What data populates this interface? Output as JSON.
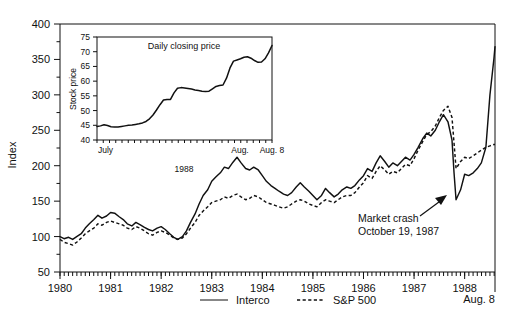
{
  "chart_data": {
    "type": "line",
    "title": "",
    "xlabel": "",
    "ylabel": "Index",
    "ylim": [
      50,
      400
    ],
    "yticks": [
      50,
      100,
      150,
      200,
      250,
      300,
      350,
      400
    ],
    "xlim": [
      1980.0,
      1988.6
    ],
    "xticks": [
      1980,
      1981,
      1982,
      1983,
      1984,
      1985,
      1986,
      1987,
      1988
    ],
    "xtick_labels": [
      "1980",
      "1981",
      "1982",
      "1983",
      "1984",
      "1985",
      "1986",
      "1987",
      "1988"
    ],
    "x_end_label": "Aug. 8",
    "grid": false,
    "legend_position": "bottom",
    "minor_ticks": "monthly",
    "annotations": [
      {
        "text_line1": "Market crash",
        "text_line2": "October 19, 1987",
        "points_to": "Interco trough, October 1987"
      }
    ],
    "series": [
      {
        "name": "Interco",
        "style": "solid",
        "x": [
          1980.0,
          1980.08,
          1980.17,
          1980.25,
          1980.33,
          1980.42,
          1980.5,
          1980.58,
          1980.67,
          1980.75,
          1980.83,
          1980.92,
          1981.0,
          1981.08,
          1981.17,
          1981.25,
          1981.33,
          1981.42,
          1981.5,
          1981.58,
          1981.67,
          1981.75,
          1981.83,
          1981.92,
          1982.0,
          1982.08,
          1982.17,
          1982.25,
          1982.33,
          1982.42,
          1982.5,
          1982.58,
          1982.67,
          1982.75,
          1982.83,
          1982.92,
          1983.0,
          1983.08,
          1983.17,
          1983.25,
          1983.33,
          1983.42,
          1983.5,
          1983.58,
          1983.67,
          1983.75,
          1983.83,
          1983.92,
          1984.0,
          1984.08,
          1984.17,
          1984.25,
          1984.33,
          1984.42,
          1984.5,
          1984.58,
          1984.67,
          1984.75,
          1984.83,
          1984.92,
          1985.0,
          1985.08,
          1985.17,
          1985.25,
          1985.33,
          1985.42,
          1985.5,
          1985.58,
          1985.67,
          1985.75,
          1985.83,
          1985.92,
          1986.0,
          1986.08,
          1986.17,
          1986.25,
          1986.33,
          1986.42,
          1986.5,
          1986.58,
          1986.67,
          1986.75,
          1986.83,
          1986.92,
          1987.0,
          1987.08,
          1987.17,
          1987.25,
          1987.33,
          1987.42,
          1987.5,
          1987.58,
          1987.67,
          1987.75,
          1987.79,
          1987.83,
          1987.92,
          1988.0,
          1988.08,
          1988.17,
          1988.25,
          1988.33,
          1988.42,
          1988.5,
          1988.58,
          1988.6
        ],
        "y": [
          100,
          97,
          99,
          96,
          100,
          104,
          112,
          118,
          124,
          130,
          126,
          129,
          134,
          133,
          128,
          124,
          118,
          115,
          120,
          117,
          113,
          110,
          108,
          112,
          114,
          110,
          104,
          99,
          96,
          100,
          108,
          120,
          132,
          146,
          158,
          166,
          178,
          184,
          190,
          198,
          196,
          205,
          212,
          204,
          196,
          194,
          198,
          194,
          186,
          178,
          172,
          168,
          164,
          160,
          158,
          162,
          170,
          176,
          170,
          164,
          158,
          152,
          158,
          168,
          162,
          156,
          160,
          166,
          170,
          168,
          172,
          180,
          186,
          196,
          192,
          204,
          214,
          206,
          198,
          204,
          200,
          206,
          212,
          208,
          216,
          226,
          238,
          246,
          242,
          250,
          262,
          272,
          262,
          236,
          190,
          152,
          166,
          188,
          186,
          190,
          196,
          204,
          226,
          300,
          352,
          368
        ]
      },
      {
        "name": "S&P 500",
        "style": "dashed",
        "x": [
          1980.0,
          1980.08,
          1980.17,
          1980.25,
          1980.33,
          1980.42,
          1980.5,
          1980.58,
          1980.67,
          1980.75,
          1980.83,
          1980.92,
          1981.0,
          1981.08,
          1981.17,
          1981.25,
          1981.33,
          1981.42,
          1981.5,
          1981.58,
          1981.67,
          1981.75,
          1981.83,
          1981.92,
          1982.0,
          1982.08,
          1982.17,
          1982.25,
          1982.33,
          1982.42,
          1982.5,
          1982.58,
          1982.67,
          1982.75,
          1982.83,
          1982.92,
          1983.0,
          1983.08,
          1983.17,
          1983.25,
          1983.33,
          1983.42,
          1983.5,
          1983.58,
          1983.67,
          1983.75,
          1983.83,
          1983.92,
          1984.0,
          1984.08,
          1984.17,
          1984.25,
          1984.33,
          1984.42,
          1984.5,
          1984.58,
          1984.67,
          1984.75,
          1984.83,
          1984.92,
          1985.0,
          1985.08,
          1985.17,
          1985.25,
          1985.33,
          1985.42,
          1985.5,
          1985.58,
          1985.67,
          1985.75,
          1985.83,
          1985.92,
          1986.0,
          1986.08,
          1986.17,
          1986.25,
          1986.33,
          1986.42,
          1986.5,
          1986.58,
          1986.67,
          1986.75,
          1986.83,
          1986.92,
          1987.0,
          1987.08,
          1987.17,
          1987.25,
          1987.33,
          1987.42,
          1987.5,
          1987.58,
          1987.67,
          1987.75,
          1987.79,
          1987.83,
          1987.92,
          1988.0,
          1988.08,
          1988.17,
          1988.25,
          1988.33,
          1988.42,
          1988.5,
          1988.58,
          1988.6
        ],
        "y": [
          96,
          92,
          90,
          88,
          92,
          98,
          104,
          108,
          112,
          118,
          116,
          120,
          122,
          120,
          118,
          116,
          112,
          110,
          114,
          112,
          108,
          104,
          102,
          106,
          108,
          106,
          102,
          98,
          96,
          98,
          104,
          112,
          120,
          130,
          136,
          142,
          148,
          150,
          152,
          156,
          154,
          158,
          160,
          156,
          152,
          154,
          158,
          156,
          152,
          148,
          146,
          144,
          142,
          140,
          142,
          146,
          150,
          152,
          150,
          146,
          144,
          142,
          148,
          152,
          150,
          148,
          152,
          156,
          158,
          158,
          162,
          170,
          176,
          186,
          182,
          192,
          200,
          194,
          188,
          192,
          190,
          196,
          202,
          200,
          210,
          222,
          234,
          244,
          248,
          256,
          268,
          278,
          284,
          268,
          232,
          196,
          206,
          212,
          210,
          214,
          218,
          222,
          226,
          228,
          230,
          230
        ]
      }
    ],
    "inset": {
      "title": "Daily closing price",
      "ylabel": "Stock price",
      "ylim": [
        40,
        75
      ],
      "yticks": [
        40,
        45,
        50,
        55,
        60,
        65,
        70,
        75
      ],
      "xtick_labels": [
        "July",
        "Aug.",
        "Aug. 8"
      ],
      "year_label": "1988",
      "grid": false,
      "series_name": "Interco daily closing price",
      "x": [
        0,
        0.02,
        0.04,
        0.06,
        0.08,
        0.1,
        0.12,
        0.14,
        0.16,
        0.18,
        0.2,
        0.22,
        0.24,
        0.26,
        0.28,
        0.3,
        0.32,
        0.34,
        0.36,
        0.38,
        0.4,
        0.42,
        0.44,
        0.46,
        0.48,
        0.5,
        0.52,
        0.54,
        0.56,
        0.58,
        0.6,
        0.62,
        0.64,
        0.66,
        0.68,
        0.7,
        0.72,
        0.74,
        0.76,
        0.78,
        0.8,
        0.82,
        0.84,
        0.86,
        0.88,
        0.9,
        0.92,
        0.94,
        0.96,
        0.98,
        1.0
      ],
      "y": [
        44.6,
        44.8,
        45.2,
        44.9,
        44.5,
        44.4,
        44.4,
        44.6,
        44.8,
        45.0,
        45.1,
        45.3,
        45.5,
        45.8,
        46.3,
        47.2,
        48.5,
        50.2,
        52.0,
        53.6,
        53.8,
        53.8,
        56.0,
        57.6,
        57.8,
        57.7,
        57.5,
        57.3,
        57.0,
        56.8,
        56.6,
        56.5,
        56.6,
        57.4,
        58.2,
        58.5,
        58.7,
        61.0,
        64.5,
        66.8,
        67.2,
        67.6,
        68.1,
        68.3,
        67.8,
        67.0,
        66.4,
        66.5,
        67.6,
        69.6,
        72.1
      ]
    }
  },
  "legend": {
    "items": [
      {
        "label": "Interco",
        "style": "solid"
      },
      {
        "label": "S&P 500",
        "style": "dashed"
      }
    ]
  },
  "axis": {
    "y_title": "Index",
    "y_labels": [
      "400",
      "350",
      "300",
      "250",
      "200",
      "150",
      "100",
      "50"
    ],
    "x_labels": [
      "1980",
      "1981",
      "1982",
      "1983",
      "1984",
      "1985",
      "1986",
      "1987",
      "1988"
    ],
    "x_end_label": "Aug. 8"
  },
  "inset_axis": {
    "title": "Daily closing price",
    "y_title": "Stock price",
    "y_labels": [
      "75",
      "70",
      "65",
      "60",
      "55",
      "50",
      "45",
      "40"
    ],
    "x_labels": [
      "July",
      "Aug.",
      "Aug. 8"
    ],
    "year_label": "1988"
  },
  "annotation": {
    "line1": "Market crash",
    "line2": "October 19, 1987"
  }
}
